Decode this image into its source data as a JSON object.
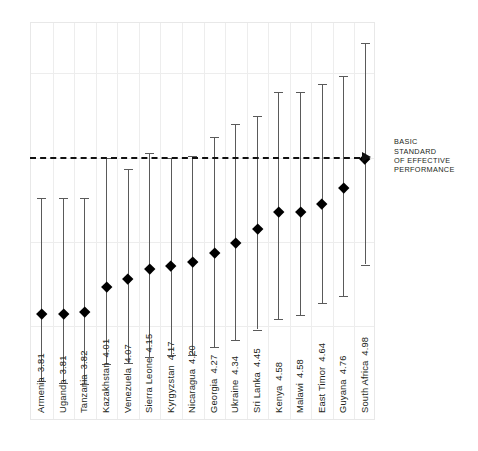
{
  "chart_data": {
    "type": "scatter",
    "title": "",
    "subtitle": "",
    "xlabel": "",
    "ylabel": "",
    "grid": true,
    "legend_position": "none",
    "ylim": [
      3.0,
      6.0
    ],
    "reference_line": {
      "value": 4.98,
      "style": "dashed",
      "label": "BASIC\nSTANDARD\nOF EFFECTIVE\nPERFORMANCE",
      "label_lines": [
        "BASIC",
        "STANDARD",
        "OF EFFECTIVE",
        "PERFORMANCE"
      ],
      "arrow": "right-arrow-icon"
    },
    "categories": [
      "Armenia",
      "Uganda",
      "Tanzania",
      "Kazakhstan",
      "Venezuela",
      "Sierra Leone",
      "Kyrgyzstan",
      "Nicaragua",
      "Georgia",
      "Ukraine",
      "Sri Lanka",
      "Kenya",
      "Malawi",
      "East Timor",
      "Guyana",
      "South Africa"
    ],
    "values": [
      3.81,
      3.81,
      3.82,
      4.01,
      4.07,
      4.15,
      4.17,
      4.2,
      4.27,
      4.34,
      4.45,
      4.58,
      4.58,
      4.64,
      4.76,
      4.98
    ],
    "error_low": [
      3.3,
      3.29,
      3.28,
      3.43,
      3.44,
      3.48,
      3.5,
      3.5,
      3.56,
      3.61,
      3.69,
      3.77,
      3.8,
      3.89,
      3.94,
      4.18
    ],
    "error_high": [
      4.68,
      4.68,
      4.68,
      4.98,
      4.9,
      5.02,
      4.98,
      5.0,
      5.14,
      5.24,
      5.3,
      5.48,
      5.48,
      5.54,
      5.6,
      5.85
    ],
    "points": [
      {
        "label": "Armenia",
        "value": 3.81,
        "low": 3.3,
        "high": 4.68
      },
      {
        "label": "Uganda",
        "value": 3.81,
        "low": 3.29,
        "high": 4.68
      },
      {
        "label": "Tanzania",
        "value": 3.82,
        "low": 3.28,
        "high": 4.68
      },
      {
        "label": "Kazakhstan",
        "value": 4.01,
        "low": 3.43,
        "high": 4.98
      },
      {
        "label": "Venezuela",
        "value": 4.07,
        "low": 3.44,
        "high": 4.9
      },
      {
        "label": "Sierra Leone",
        "value": 4.15,
        "low": 3.48,
        "high": 5.02
      },
      {
        "label": "Kyrgyzstan",
        "value": 4.17,
        "low": 3.5,
        "high": 4.98
      },
      {
        "label": "Nicaragua",
        "value": 4.2,
        "low": 3.5,
        "high": 5.0
      },
      {
        "label": "Georgia",
        "value": 4.27,
        "low": 3.56,
        "high": 5.14
      },
      {
        "label": "Ukraine",
        "value": 4.34,
        "low": 3.61,
        "high": 5.24
      },
      {
        "label": "Sri Lanka",
        "value": 4.45,
        "low": 3.69,
        "high": 5.3
      },
      {
        "label": "Kenya",
        "value": 4.58,
        "low": 3.77,
        "high": 5.48
      },
      {
        "label": "Malawi",
        "value": 4.58,
        "low": 3.8,
        "high": 5.48
      },
      {
        "label": "East Timor",
        "value": 4.64,
        "low": 3.89,
        "high": 5.54
      },
      {
        "label": "Guyana",
        "value": 4.76,
        "low": 3.94,
        "high": 5.6
      },
      {
        "label": "South Africa",
        "value": 4.98,
        "low": 4.18,
        "high": 5.85
      }
    ],
    "gridlines_y": [
      5.62,
      4.98,
      4.35,
      3.72
    ],
    "colors": {
      "marker": "#000000",
      "errorbar": "#5a5a5a",
      "grid": "#ededed",
      "refline": "#111111",
      "text": "#231f20"
    }
  }
}
